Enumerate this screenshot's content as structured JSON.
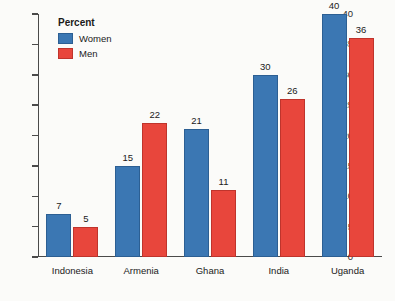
{
  "chart_data": {
    "type": "bar",
    "title": "",
    "xlabel": "",
    "ylabel": "",
    "ylim": [
      0,
      40
    ],
    "yticks": [
      0,
      5,
      10,
      15,
      20,
      25,
      30,
      35,
      40
    ],
    "grid": false,
    "legend_position": "top-left",
    "legend_title": "Percent",
    "categories": [
      "Indonesia",
      "Armenia",
      "Ghana",
      "India",
      "Uganda"
    ],
    "series": [
      {
        "name": "Women",
        "color": "#3b77b3",
        "values": [
          7,
          15,
          21,
          30,
          40
        ]
      },
      {
        "name": "Men",
        "color": "#e8463c",
        "values": [
          5,
          22,
          11,
          26,
          36
        ]
      }
    ]
  }
}
